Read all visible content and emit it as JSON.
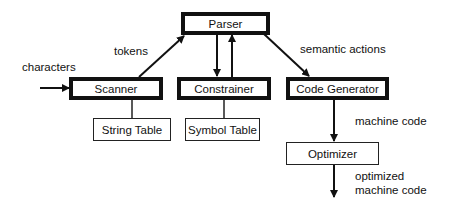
{
  "diagram": {
    "nodes": {
      "parser": "Parser",
      "scanner": "Scanner",
      "constrainer": "Constrainer",
      "code_generator": "Code Generator",
      "string_table": "String Table",
      "symbol_table": "Symbol Table",
      "optimizer": "Optimizer"
    },
    "edge_labels": {
      "characters": "characters",
      "tokens": "tokens",
      "semantic_actions": "semantic actions",
      "machine_code": "machine code",
      "optimized_line1": "optimized",
      "optimized_line2": "machine code"
    },
    "edges": [
      {
        "from": "input",
        "to": "Scanner",
        "label": "characters"
      },
      {
        "from": "Scanner",
        "to": "Parser",
        "label": "tokens"
      },
      {
        "from": "Parser",
        "to": "Constrainer",
        "label": ""
      },
      {
        "from": "Constrainer",
        "to": "Parser",
        "label": ""
      },
      {
        "from": "Parser",
        "to": "Code Generator",
        "label": "semantic actions"
      },
      {
        "from": "Scanner",
        "to": "String Table",
        "label": "",
        "type": "line"
      },
      {
        "from": "Constrainer",
        "to": "Symbol Table",
        "label": "",
        "type": "line"
      },
      {
        "from": "Code Generator",
        "to": "Optimizer",
        "label": "machine code"
      },
      {
        "from": "Optimizer",
        "to": "output",
        "label": "optimized machine code"
      }
    ]
  }
}
